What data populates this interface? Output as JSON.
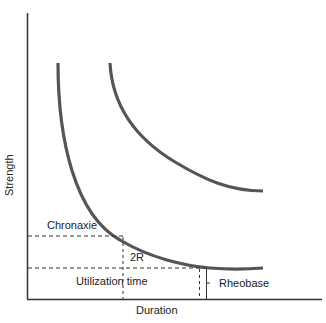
{
  "diagram": {
    "axes": {
      "y_label": "Strength",
      "x_label": "Duration"
    },
    "labels": {
      "chronaxie": "Chronaxie",
      "two_r": "2R",
      "utilization_time": "Utilization time",
      "rheobase": "Rheobase"
    },
    "colors": {
      "curve": "#555555",
      "axis": "#333333",
      "dash": "#333333"
    }
  }
}
